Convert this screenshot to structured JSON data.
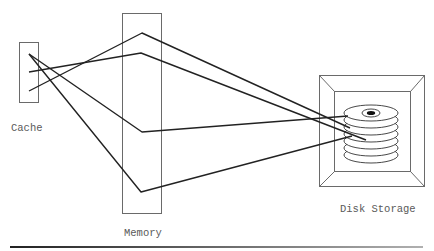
{
  "labels": {
    "cache": "Cache",
    "memory": "Memory",
    "disk": "Disk Storage"
  },
  "colors": {
    "line": "#222222",
    "box": "#6a6a6a",
    "text": "#5a5a5a",
    "rule_start": "#222222",
    "rule_end": "#aaaaaa"
  },
  "components": {
    "cache": {
      "x": 19,
      "y": 42,
      "w": 19,
      "h": 60
    },
    "memory": {
      "x": 122,
      "y": 13,
      "w": 39,
      "h": 200
    },
    "disk_frame_outer": {
      "x": 319,
      "y": 75,
      "w": 105,
      "h": 111
    },
    "disk_frame_inner": {
      "x": 334,
      "y": 91,
      "w": 76,
      "h": 80
    },
    "disk_stack": {
      "cx": 371,
      "top_cy": 113,
      "rx": 27,
      "ry": 8,
      "platters": 7,
      "spacing": 7
    }
  },
  "connections": [
    {
      "from": "cache",
      "via": "memory",
      "to": "disk",
      "points": [
        [
          29,
          54
        ],
        [
          142,
          132
        ],
        [
          348,
          116
        ]
      ]
    },
    {
      "from": "cache",
      "via": "memory",
      "to": "disk",
      "points": [
        [
          29,
          54
        ],
        [
          141,
          192
        ],
        [
          352,
          136
        ]
      ]
    },
    {
      "from": "cache",
      "via": "memory",
      "to": "disk",
      "points": [
        [
          29,
          72
        ],
        [
          141,
          53
        ],
        [
          366,
          140
        ]
      ]
    },
    {
      "from": "cache",
      "via": "memory",
      "to": "disk",
      "points": [
        [
          29,
          91
        ],
        [
          142,
          33
        ],
        [
          350,
          128
        ]
      ]
    }
  ]
}
